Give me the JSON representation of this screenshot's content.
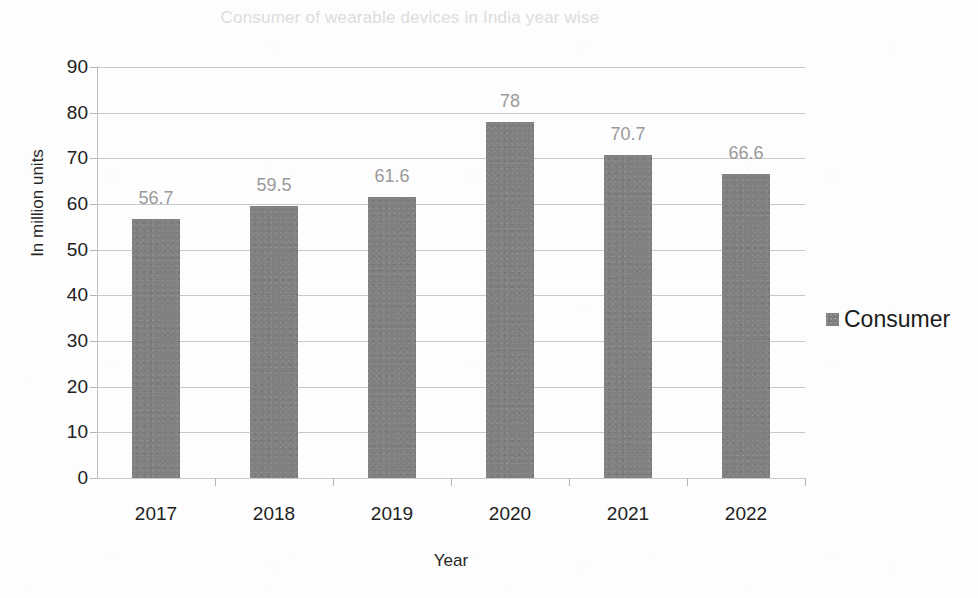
{
  "chart_data": {
    "type": "bar",
    "title": "Consumer of wearable devices in India year wise",
    "xlabel": "Year",
    "ylabel": "In million units",
    "categories": [
      "2017",
      "2018",
      "2019",
      "2020",
      "2021",
      "2022"
    ],
    "values": [
      56.7,
      59.5,
      61.6,
      78,
      70.7,
      66.6
    ],
    "value_labels": [
      "56.7",
      "59.5",
      "61.6",
      "78",
      "70.7",
      "66.6"
    ],
    "series": [
      {
        "name": "Consumer",
        "values": [
          56.7,
          59.5,
          61.6,
          78,
          70.7,
          66.6
        ]
      }
    ],
    "ylim": [
      0,
      90
    ],
    "ytick_step": 10,
    "yticks": [
      "90",
      "80",
      "70",
      "60",
      "50",
      "40",
      "30",
      "20",
      "10",
      "0"
    ],
    "grid": true,
    "grid_axis": "y",
    "legend_position": "right",
    "legend": [
      "Consumer"
    ],
    "colors": {
      "bar": "#808080",
      "title": "#dcdcdc",
      "value_label": "#9a9a9a",
      "gridline": "#c9c9c9",
      "axis_text": "#212121",
      "background": "#fdfdfd"
    }
  },
  "legend": {
    "entries": [
      {
        "label": "Consumer",
        "swatch_name": "legend-swatch-consumer"
      }
    ]
  }
}
